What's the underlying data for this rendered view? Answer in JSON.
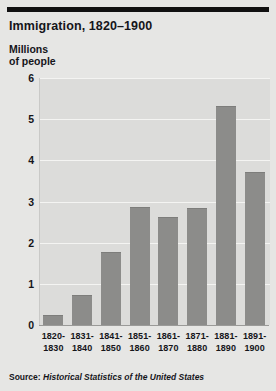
{
  "chart_data": {
    "type": "bar",
    "title": "Immigration, 1820–1900",
    "ylabel": "Millions\nof people",
    "xlabel": "",
    "categories": [
      "1820-\n1830",
      "1831-\n1840",
      "1841-\n1850",
      "1851-\n1860",
      "1861-\n1870",
      "1871-\n1880",
      "1881-\n1890",
      "1891-\n1900"
    ],
    "values": [
      0.22,
      0.7,
      1.75,
      2.84,
      2.6,
      2.81,
      5.29,
      3.69
    ],
    "ylim": [
      0,
      6
    ],
    "yticks": [
      "0",
      "1",
      "2",
      "3",
      "4",
      "5",
      "6"
    ],
    "ytick_values": [
      0,
      1,
      2,
      3,
      4,
      5,
      6
    ],
    "grid": true,
    "legend": "none",
    "bar_color": "#8c8c8a",
    "plot_background": "#dcdcda"
  },
  "footer": {
    "source_prefix": "Source: ",
    "source_title": "Historical Statistics of the United States"
  }
}
